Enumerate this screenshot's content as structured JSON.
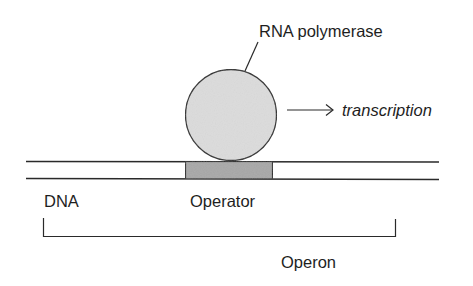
{
  "diagram": {
    "labels": {
      "rna_polymerase": "RNA polymerase",
      "transcription": "transcription",
      "dna": "DNA",
      "operator": "Operator",
      "operon": "Operon"
    },
    "colors": {
      "stroke": "#2a2a2a",
      "polymerase_fill": "#dcdcdc",
      "operator_fill": "#a8a8a8",
      "text": "#1e1e1e",
      "background": "#ffffff"
    }
  }
}
